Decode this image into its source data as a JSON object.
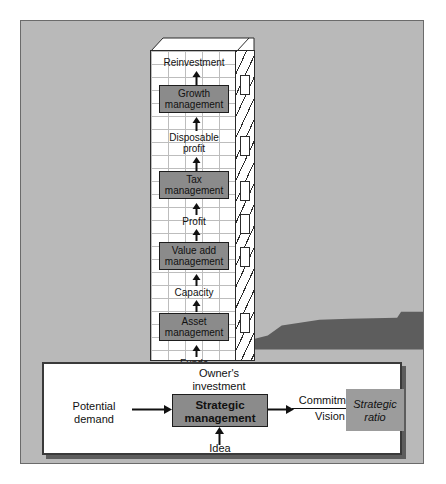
{
  "diagram": {
    "colors": {
      "background": "#b9b9b9",
      "ground": "#5d5d5d",
      "box_fill": "#8b8b8b",
      "panel_fill": "#ffffff",
      "ratio_box_fill": "#9c9c9c",
      "outline": "#1d1d1d"
    }
  },
  "tower": {
    "levels": [
      {
        "label": "Reinvestment",
        "type": "flow-label"
      },
      {
        "label": "Growth\nmanagement",
        "line1": "Growth",
        "line2": "management",
        "type": "process-box"
      },
      {
        "label": "Disposable\nprofit",
        "line1": "Disposable",
        "line2": "profit",
        "type": "flow-label"
      },
      {
        "label": "Tax\nmanagement",
        "line1": "Tax",
        "line2": "management",
        "type": "process-box"
      },
      {
        "label": "Profit",
        "type": "flow-label"
      },
      {
        "label": "Value add\nmanagement",
        "line1": "Value add",
        "line2": "management",
        "type": "process-box"
      },
      {
        "label": "Capacity",
        "type": "flow-label"
      },
      {
        "label": "Asset\nmanagement",
        "line1": "Asset",
        "line2": "management",
        "type": "process-box"
      },
      {
        "label": "Funds",
        "type": "flow-label"
      },
      {
        "label": "Funding\nmanagement",
        "line1": "Funding",
        "line2": "management",
        "type": "process-box"
      }
    ]
  },
  "panel": {
    "input_label": {
      "line1": "Potential",
      "line2": "demand"
    },
    "top_output_label": {
      "line1": "Owner's",
      "line2": "investment"
    },
    "bottom_input_label": "Idea",
    "center_box": {
      "line1": "Strategic",
      "line2": "management"
    },
    "link_label": {
      "numerator": "Commitment",
      "denominator": "Vision"
    },
    "result_box": {
      "line1": "Strategic",
      "line2": "ratio"
    }
  }
}
